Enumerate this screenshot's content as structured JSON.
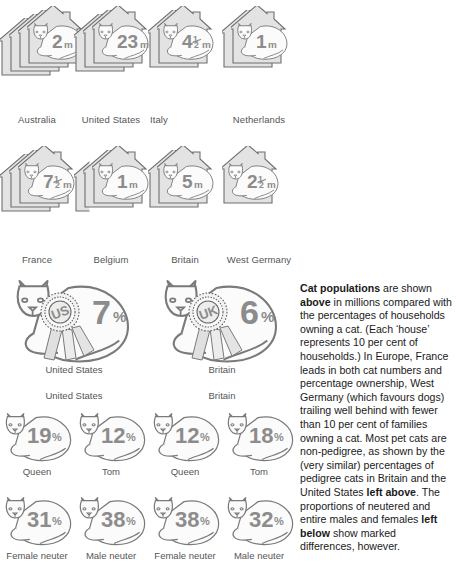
{
  "title": "Cat populations",
  "colors": {
    "house_fill": "#e3e3e3",
    "house_stroke": "#6f6f6f",
    "cat_fill": "#fbfbfb",
    "cat_stroke": "#7a7a7a",
    "number_fill": "#8c8c8c",
    "label_color": "#555555",
    "text_color": "#1a1a1a",
    "background": "#ffffff"
  },
  "chart_data": {
    "type": "table",
    "title": "Cat populations",
    "subtitle": "Cat numbers in millions and percentage of households owning a cat",
    "series": [
      {
        "name": "Cat population (millions) and household ownership (houses)",
        "unit_numbers": "m",
        "unit_houses": "10% of households",
        "categories": [
          "Australia",
          "United States",
          "Italy",
          "Netherlands",
          "France",
          "Belgium",
          "Britain",
          "West Germany"
        ],
        "values": [
          2,
          23,
          4.5,
          1,
          7.5,
          1,
          5,
          2.5
        ],
        "value_labels": [
          "2m",
          "23m",
          "4½m",
          "1m",
          "7½m",
          "1m",
          "5m",
          "2½m"
        ],
        "houses": [
          4,
          3,
          2,
          2,
          3,
          2.5,
          2,
          1
        ],
        "household_percent": [
          40,
          30,
          20,
          20,
          30,
          25,
          20,
          10
        ]
      },
      {
        "name": "Pedigree cats as percentage of pet cats",
        "categories": [
          "United States",
          "Britain"
        ],
        "values": [
          7,
          6
        ],
        "value_labels": [
          "7%",
          "6%"
        ],
        "rosette_text": [
          "US",
          "UK"
        ]
      },
      {
        "name": "Entire cats by sex (per cent)",
        "groups": [
          "United States",
          "Britain"
        ],
        "categories": [
          "Queen",
          "Tom"
        ],
        "values": [
          [
            19,
            12
          ],
          [
            12,
            18
          ]
        ],
        "value_labels": [
          [
            "19%",
            "12%"
          ],
          [
            "12%",
            "18%"
          ]
        ]
      },
      {
        "name": "Neutered cats by sex (per cent)",
        "groups": [
          "United States",
          "Britain"
        ],
        "categories": [
          "Female neuter",
          "Male neuter"
        ],
        "values": [
          [
            31,
            38
          ],
          [
            38,
            32
          ]
        ],
        "value_labels": [
          [
            "31%",
            "38%"
          ],
          [
            "38%",
            "32%"
          ]
        ]
      }
    ]
  },
  "house_rows": [
    [
      {
        "country": "Australia",
        "number": "2",
        "frac": "",
        "unit": "m",
        "houses": 4,
        "label_align": "center"
      },
      {
        "country": "United States",
        "number": "23",
        "frac": "",
        "unit": "m",
        "houses": 3,
        "label_align": "center"
      },
      {
        "country": "Italy",
        "number": "4",
        "frac": "½",
        "unit": "m",
        "houses": 2,
        "label_align": "left"
      },
      {
        "country": "Netherlands",
        "number": "1",
        "frac": "",
        "unit": "m",
        "houses": 2,
        "label_align": "center"
      }
    ],
    [
      {
        "country": "France",
        "number": "7",
        "frac": "½",
        "unit": "m",
        "houses": 3,
        "label_align": "center"
      },
      {
        "country": "Belgium",
        "number": "1",
        "frac": "",
        "unit": "m",
        "houses": 2.5,
        "label_align": "center"
      },
      {
        "country": "Britain",
        "number": "5",
        "frac": "",
        "unit": "m",
        "houses": 2,
        "label_align": "center"
      },
      {
        "country": "West Germany",
        "number": "2",
        "frac": "½",
        "unit": "m",
        "houses": 1,
        "label_align": "center"
      }
    ]
  ],
  "rosettes": [
    {
      "label": "United States",
      "value": "7",
      "unit": "%",
      "badge": "US"
    },
    {
      "label": "Britain",
      "value": "6",
      "unit": "%",
      "badge": "UK"
    }
  ],
  "entire_group_heads": [
    "United States",
    "Britain"
  ],
  "entire_cats": [
    {
      "label": "Queen",
      "value": "19",
      "unit": "%"
    },
    {
      "label": "Tom",
      "value": "12",
      "unit": "%"
    },
    {
      "label": "Queen",
      "value": "12",
      "unit": "%"
    },
    {
      "label": "Tom",
      "value": "18",
      "unit": "%"
    }
  ],
  "neuter_cats": [
    {
      "label": "Female neuter",
      "value": "31",
      "unit": "%"
    },
    {
      "label": "Male neuter",
      "value": "38",
      "unit": "%"
    },
    {
      "label": "Female neuter",
      "value": "38",
      "unit": "%"
    },
    {
      "label": "Male neuter",
      "value": "32",
      "unit": "%"
    }
  ],
  "caption": {
    "paragraph_parts": [
      {
        "text": "Cat populations",
        "bold": true
      },
      {
        "text": " are shown ",
        "bold": false
      },
      {
        "text": "above",
        "bold": true
      },
      {
        "text": " in millions compared with the percentages of households owning a cat. (Each ‘house’ represents 10 per cent of households.) In Europe, France leads in both cat numbers and percentage ownership, West Germany (which favours dogs) trailing well behind with fewer than 10 per cent of families owning a cat. Most pet cats are non-pedigree, as shown by the (very similar) percentages of pedigree cats in Britain and the United States ",
        "bold": false
      },
      {
        "text": "left above",
        "bold": true
      },
      {
        "text": ". The proportions of neutered and entire males and females ",
        "bold": false
      },
      {
        "text": "left below",
        "bold": true
      },
      {
        "text": " show marked differences, however.",
        "bold": false
      }
    ]
  }
}
